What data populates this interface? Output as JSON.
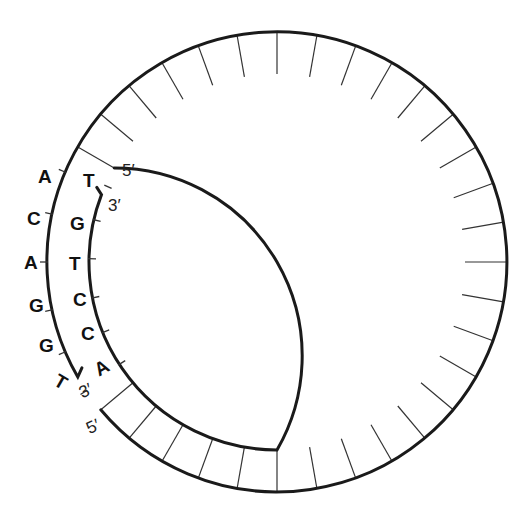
{
  "diagram": {
    "title": "",
    "geometry": {
      "center": [
        277,
        262
      ],
      "outer_radius": 230,
      "inner_radius": 188,
      "segment_angle_deg": 10,
      "ring_start_deg": -150,
      "ring_end_deg": 140,
      "outer_strand_end_deg": 150,
      "inner_strand_end_deg": -159
    },
    "outer_strand": {
      "bases": [
        "A",
        "C",
        "A",
        "G",
        "G",
        "T"
      ],
      "end_label_top": "5′",
      "end_label_bottom": "3′"
    },
    "inner_strand": {
      "bases": [
        "T",
        "G",
        "T",
        "C",
        "C",
        "A"
      ],
      "end_label_top": "3′",
      "end_label_bottom": "5′"
    },
    "labels": {
      "top_five_prime": "5′",
      "inner_three_prime": "3′",
      "outer_three_prime": "3′",
      "bottom_five_prime": "5′"
    },
    "colors": {
      "line": "#1a1a1a",
      "background": "#ffffff"
    }
  }
}
